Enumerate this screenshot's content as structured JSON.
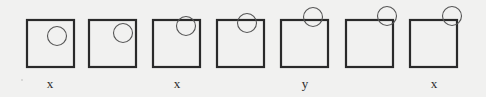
{
  "diagram": {
    "colors": {
      "background": "#f1f1f0",
      "square_stroke": "#2a2a2a",
      "circle_stroke": "#555555",
      "label_text": "#2a2a2a"
    },
    "frames": [
      {
        "index": 1,
        "square": {
          "x": 27,
          "y": 20,
          "size": 47
        },
        "circle": {
          "cx": 57,
          "cy": 36,
          "r": 9.5
        },
        "label": "x"
      },
      {
        "index": 2,
        "square": {
          "x": 89,
          "y": 20,
          "size": 47
        },
        "circle": {
          "cx": 123,
          "cy": 33,
          "r": 9.5
        },
        "label": ""
      },
      {
        "index": 3,
        "square": {
          "x": 153,
          "y": 20,
          "size": 47
        },
        "circle": {
          "cx": 186,
          "cy": 26,
          "r": 9.5
        },
        "label": "x"
      },
      {
        "index": 4,
        "square": {
          "x": 217,
          "y": 20,
          "size": 47
        },
        "circle": {
          "cx": 247,
          "cy": 23,
          "r": 9.5
        },
        "label": ""
      },
      {
        "index": 5,
        "square": {
          "x": 281,
          "y": 20,
          "size": 47
        },
        "circle": {
          "cx": 313,
          "cy": 17,
          "r": 9.5
        },
        "label": "y"
      },
      {
        "index": 6,
        "square": {
          "x": 346,
          "y": 20,
          "size": 47
        },
        "circle": {
          "cx": 387,
          "cy": 16,
          "r": 9.5
        },
        "label": ""
      },
      {
        "index": 7,
        "square": {
          "x": 410,
          "y": 20,
          "size": 47
        },
        "circle": {
          "cx": 452,
          "cy": 16,
          "r": 9.5
        },
        "label": "x"
      }
    ],
    "labels": [
      {
        "text": "x",
        "x": 50
      },
      {
        "text": "x",
        "x": 177
      },
      {
        "text": "y",
        "x": 305
      },
      {
        "text": "x",
        "x": 434
      }
    ]
  }
}
